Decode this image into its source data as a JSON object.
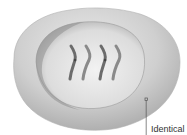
{
  "diagram": {
    "chromosome_count": 4,
    "colors": {
      "outer_cell": "#c4c4c4",
      "outer_cell_highlight": "#e6e6e6",
      "nucleus": "#d6d6d6",
      "nucleus_highlight": "#efefef",
      "chromosome": "#8a8a8a",
      "chromosome_dark": "#5a5a5a",
      "leader_line": "#555555"
    }
  },
  "labels": {
    "pointer_label": "Identical"
  }
}
